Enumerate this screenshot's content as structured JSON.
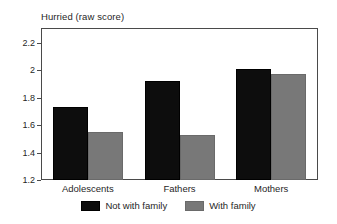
{
  "chart_data": {
    "type": "bar",
    "title": "Hurried (raw score)",
    "xlabel": "",
    "ylabel": "",
    "categories": [
      "Adolescents",
      "Fathers",
      "Mothers"
    ],
    "series": [
      {
        "name": "Not with family",
        "color": "#0d0d0d",
        "values": [
          1.73,
          1.92,
          2.01
        ]
      },
      {
        "name": "With family",
        "color": "#787878",
        "values": [
          1.55,
          1.53,
          1.97
        ]
      }
    ],
    "ylim": [
      1.2,
      2.3
    ],
    "y_ticks": [
      1.2,
      1.4,
      1.6,
      1.8,
      2.0,
      2.2
    ],
    "y_tick_labels": [
      "1.2",
      "1.4",
      "1.6",
      "1.8",
      "2",
      "2.2"
    ],
    "grid": false,
    "legend_position": "bottom-center",
    "frame": true,
    "annotations": []
  }
}
